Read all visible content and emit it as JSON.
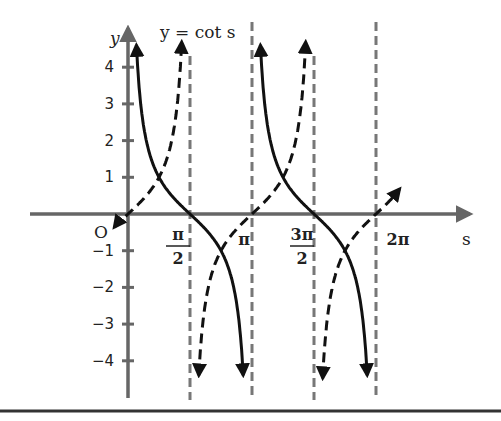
{
  "chart_data": {
    "type": "line",
    "title": "y = cot s",
    "xlabel": "s",
    "ylabel": "y",
    "origin_label": "O",
    "xlim": [
      -0.35,
      5.6
    ],
    "ylim": [
      -4.6,
      4.8
    ],
    "y_ticks": [
      4,
      3,
      2,
      1,
      -1,
      -2,
      -3,
      -4
    ],
    "y_tick_labels": [
      "4",
      "3",
      "2",
      "1",
      "−1",
      "−2",
      "−3",
      "−4"
    ],
    "x_ticks": [
      {
        "value": 1.5708,
        "num": "π",
        "den": "2"
      },
      {
        "value": 3.1416,
        "num": "π",
        "den": ""
      },
      {
        "value": 4.7124,
        "num": "3π",
        "den": "2"
      },
      {
        "value": 6.2832,
        "num": "2π",
        "den": ""
      }
    ],
    "asymptotes": [
      1.5708,
      3.1416,
      4.7124,
      6.2832
    ],
    "series": [
      {
        "name": "cot s",
        "style": "solid",
        "function": "cot"
      },
      {
        "name": "tan s",
        "style": "dashed",
        "function": "tan"
      }
    ],
    "grid": false,
    "colors": {
      "axis": "#666666",
      "curve": "#111111",
      "asymptote": "#777777"
    }
  }
}
